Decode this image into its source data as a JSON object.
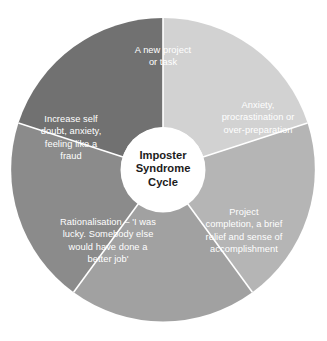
{
  "diagram": {
    "title": "Imposter Syndrome Cycle",
    "type": "cycle-wheel",
    "background_color": "#ffffff",
    "divider_color": "#ffffff",
    "hub": {
      "label": "Imposter\nSyndrome\nCycle",
      "text_color": "#1c1c1c",
      "fill_color": "#ffffff"
    },
    "segments": [
      {
        "id": "new-project",
        "label": "A new project\nor task",
        "color": "#d2d2d2",
        "text_color": "#ffffff",
        "position": "top"
      },
      {
        "id": "anxiety",
        "label": "Anxiety,\nprocrastination or\nover-preparation",
        "color": "#b5b5b5",
        "text_color": "#ffffff",
        "position": "right"
      },
      {
        "id": "project-completion",
        "label": "Project\ncompletion, a brief\nrelief and sense of\naccomplishment",
        "color": "#a1a1a1",
        "text_color": "#ffffff",
        "position": "bottom-right"
      },
      {
        "id": "rationalisation",
        "label": "Rationalisation – 'I was\nlucky. Somebody else\nwould have done a\nbetter job'",
        "color": "#8b8b8b",
        "text_color": "#ffffff",
        "position": "bottom-left"
      },
      {
        "id": "self-doubt",
        "label": "Increase self\ndoubt, anxiety,\nfeeling like a\nfraud",
        "color": "#717171",
        "text_color": "#ffffff",
        "position": "left"
      }
    ]
  }
}
